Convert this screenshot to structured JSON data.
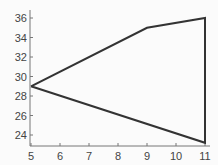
{
  "chart_data": {
    "type": "line",
    "title": "",
    "xlabel": "",
    "ylabel": "",
    "xlim": [
      5,
      11
    ],
    "ylim": [
      23,
      36.5
    ],
    "grid": false,
    "legend": null,
    "x_ticks": [
      "5",
      "6",
      "7",
      "8",
      "9",
      "10",
      "11"
    ],
    "y_ticks": [
      "24",
      "26",
      "28",
      "30",
      "32",
      "34",
      "36"
    ],
    "series": [
      {
        "name": "polygon",
        "closed": true,
        "color": "#333333",
        "points": [
          [
            5,
            29
          ],
          [
            9,
            35
          ],
          [
            11,
            36
          ],
          [
            11,
            23.2
          ],
          [
            5,
            29
          ]
        ]
      }
    ]
  }
}
